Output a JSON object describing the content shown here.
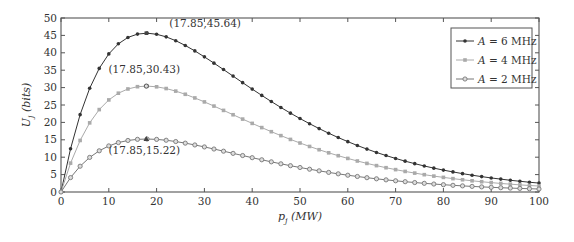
{
  "chart_data": {
    "type": "line",
    "title": "",
    "xlabel": "p",
    "xlabel_sub": "j",
    "xlabel_unit": " (MW)",
    "ylabel": "U",
    "ylabel_sub": "j",
    "ylabel_unit": " (bits)",
    "xlim": [
      0,
      100
    ],
    "ylim": [
      0,
      50
    ],
    "xticks": [
      0,
      10,
      20,
      30,
      40,
      50,
      60,
      70,
      80,
      90,
      100
    ],
    "yticks": [
      0,
      5,
      10,
      15,
      20,
      25,
      30,
      35,
      40,
      45,
      50
    ],
    "grid": false,
    "legend_position": "top-right",
    "x": [
      0,
      2,
      4,
      6,
      8,
      10,
      12,
      14,
      16,
      18,
      20,
      22,
      24,
      26,
      28,
      30,
      32,
      34,
      36,
      38,
      40,
      42,
      44,
      46,
      48,
      50,
      52,
      54,
      56,
      58,
      60,
      62,
      64,
      66,
      68,
      70,
      72,
      74,
      76,
      78,
      80,
      82,
      84,
      86,
      88,
      90,
      92,
      94,
      96,
      98,
      100
    ],
    "series": [
      {
        "name": "A=6 MHz",
        "legend_var": "A",
        "legend_rest": " = 6 MHz",
        "color": "#333333",
        "marker": "dot",
        "values": [
          0,
          12.43,
          22.22,
          29.8,
          35.52,
          39.69,
          42.58,
          44.41,
          45.38,
          45.64,
          45.33,
          44.58,
          43.48,
          42.11,
          40.54,
          38.83,
          37.03,
          35.18,
          33.3,
          31.42,
          29.57,
          27.76,
          25.99,
          24.29,
          22.66,
          21.11,
          19.63,
          18.22,
          16.89,
          15.64,
          14.47,
          13.36,
          12.33,
          11.37,
          10.47,
          9.64,
          8.86,
          8.14,
          7.48,
          6.86,
          6.29,
          5.77,
          5.28,
          4.83,
          4.42,
          4.04,
          3.7,
          3.37,
          3.08,
          2.81,
          2.56
        ]
      },
      {
        "name": "A=4 MHz",
        "legend_var": "A",
        "legend_rest": " = 4 MHz",
        "color": "#aaaaaa",
        "marker": "square",
        "values": [
          0,
          8.29,
          14.81,
          19.87,
          23.68,
          26.46,
          28.39,
          29.61,
          30.26,
          30.43,
          30.23,
          29.73,
          28.99,
          28.08,
          27.03,
          25.89,
          24.69,
          23.45,
          22.2,
          20.95,
          19.72,
          18.51,
          17.33,
          16.2,
          15.11,
          14.08,
          13.09,
          12.15,
          11.26,
          10.43,
          9.65,
          8.91,
          8.22,
          7.58,
          6.98,
          6.43,
          5.91,
          5.43,
          4.98,
          4.57,
          4.2,
          3.84,
          3.52,
          3.22,
          2.95,
          2.7,
          2.46,
          2.25,
          2.05,
          1.87,
          1.71
        ]
      },
      {
        "name": "A=2 MHz",
        "legend_var": "A",
        "legend_rest": " = 2 MHz",
        "color": "#777777",
        "marker": "circle",
        "values": [
          0,
          4.14,
          7.41,
          9.94,
          11.84,
          13.24,
          14.2,
          14.81,
          15.13,
          15.22,
          15.12,
          14.87,
          14.5,
          14.04,
          13.52,
          12.95,
          12.35,
          11.73,
          11.1,
          10.48,
          9.86,
          9.26,
          8.67,
          8.1,
          7.56,
          7.04,
          6.55,
          6.08,
          5.63,
          5.22,
          4.82,
          4.46,
          4.11,
          3.79,
          3.49,
          3.22,
          2.96,
          2.72,
          2.49,
          2.29,
          2.1,
          1.92,
          1.76,
          1.61,
          1.47,
          1.35,
          1.23,
          1.13,
          1.03,
          0.94,
          0.86
        ]
      }
    ],
    "annotations": [
      {
        "text": "(17.85,45.64)",
        "x": 17.85,
        "y": 45.64,
        "series": "A=6 MHz",
        "peak_marker": "square"
      },
      {
        "text": "(17.85,30.43)",
        "x": 17.85,
        "y": 30.43,
        "series": "A=4 MHz",
        "peak_marker": "circle"
      },
      {
        "text": "(17.85,15.22)",
        "x": 17.85,
        "y": 15.22,
        "series": "A=2 MHz",
        "peak_marker": "triangle"
      }
    ]
  }
}
